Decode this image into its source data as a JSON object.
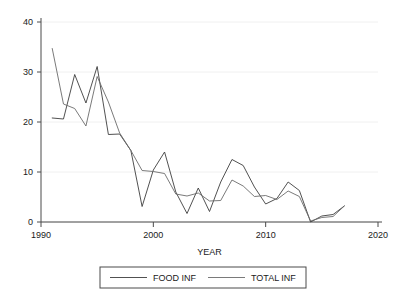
{
  "chart_data": {
    "type": "line",
    "title": "",
    "xlabel": "YEAR",
    "ylabel": "",
    "xlim": [
      1990,
      2020
    ],
    "ylim": [
      0,
      40
    ],
    "xticks": [
      1990,
      2000,
      2010,
      2020
    ],
    "xtick_labels": [
      "1990",
      "2000",
      "2010",
      "2020"
    ],
    "yticks": [
      0,
      10,
      20,
      30,
      40
    ],
    "ytick_labels": [
      "0",
      "10",
      "20",
      "30",
      "40"
    ],
    "grid": true,
    "legend_position": "bottom",
    "x": [
      1991,
      1992,
      1993,
      1994,
      1995,
      1996,
      1997,
      1998,
      1999,
      2000,
      2001,
      2002,
      2003,
      2004,
      2005,
      2006,
      2007,
      2008,
      2009,
      2010,
      2011,
      2012,
      2013,
      2014,
      2015,
      2016,
      2017
    ],
    "series": [
      {
        "name": "FOOD INF",
        "color": "#3d3d3d",
        "values": [
          20.8,
          20.6,
          29.5,
          23.8,
          31.1,
          17.5,
          17.6,
          14.3,
          3.1,
          10.4,
          14.0,
          6.0,
          1.7,
          6.8,
          2.1,
          8.0,
          12.5,
          11.3,
          7.0,
          3.6,
          4.7,
          8.0,
          6.3,
          0.0,
          1.2,
          1.5,
          3.2
        ]
      },
      {
        "name": "TOTAL INF",
        "color": "#6b6b6b",
        "values": [
          34.7,
          23.6,
          22.7,
          19.2,
          29.1,
          24.0,
          17.8,
          14.3,
          10.3,
          10.1,
          9.7,
          5.6,
          5.2,
          5.8,
          4.2,
          4.3,
          8.4,
          7.2,
          5.1,
          5.3,
          4.5,
          6.2,
          5.1,
          0.2,
          0.9,
          1.1,
          3.2
        ]
      }
    ]
  },
  "legend": {
    "entries": [
      {
        "label": "FOOD INF"
      },
      {
        "label": "TOTAL INF"
      }
    ]
  }
}
